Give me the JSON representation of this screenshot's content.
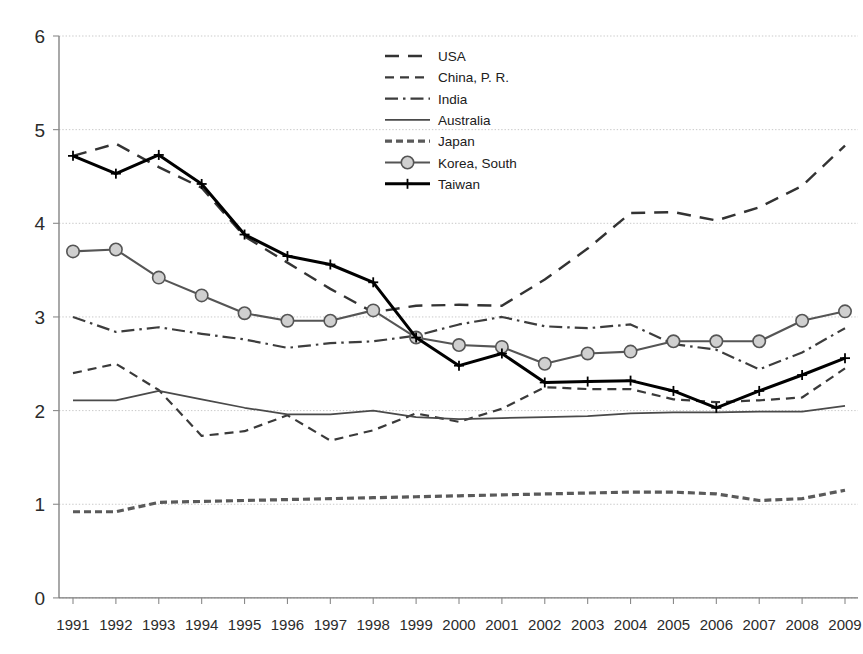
{
  "chart_data": {
    "type": "line",
    "title": "",
    "subtitle": "",
    "xlabel": "",
    "ylabel": "",
    "grid": true,
    "legend_position": "inside-top-center",
    "x": [
      1991,
      1992,
      1993,
      1994,
      1995,
      1996,
      1997,
      1998,
      1999,
      2000,
      2001,
      2002,
      2003,
      2004,
      2005,
      2006,
      2007,
      2008,
      2009
    ],
    "categories": [
      "1991",
      "1992",
      "1993",
      "1994",
      "1995",
      "1996",
      "1997",
      "1998",
      "1999",
      "2000",
      "2001",
      "2002",
      "2003",
      "2004",
      "2005",
      "2006",
      "2007",
      "2008",
      "2009"
    ],
    "xlim": [
      1991,
      2009
    ],
    "ylim": [
      0,
      6
    ],
    "yticks": [
      0,
      1,
      2,
      3,
      4,
      5,
      6
    ],
    "ytick_labels": [
      "0",
      "1",
      "2",
      "3",
      "4",
      "5",
      "6"
    ],
    "series": [
      {
        "name": "USA",
        "style": "long-dash",
        "color": "#333333",
        "width": 2.4,
        "marker": "none",
        "values": [
          4.72,
          4.85,
          4.6,
          4.38,
          3.86,
          3.58,
          3.3,
          3.05,
          3.12,
          3.13,
          3.12,
          3.4,
          3.73,
          4.11,
          4.12,
          4.03,
          4.17,
          4.4,
          4.83
        ]
      },
      {
        "name": "China, P. R.",
        "style": "short-dash",
        "color": "#3a3a3a",
        "width": 2.2,
        "marker": "none",
        "values": [
          2.4,
          2.5,
          2.22,
          1.73,
          1.78,
          1.95,
          1.68,
          1.79,
          1.97,
          1.88,
          2.02,
          2.25,
          2.23,
          2.23,
          2.12,
          2.09,
          2.11,
          2.14,
          2.45
        ]
      },
      {
        "name": "India",
        "style": "dash-dot",
        "color": "#3d3d3d",
        "width": 2.2,
        "marker": "none",
        "values": [
          3.0,
          2.84,
          2.89,
          2.82,
          2.76,
          2.67,
          2.72,
          2.74,
          2.8,
          2.92,
          3.0,
          2.9,
          2.88,
          2.92,
          2.71,
          2.65,
          2.44,
          2.62,
          2.88
        ]
      },
      {
        "name": "Australia",
        "style": "solid-thin",
        "color": "#4a4a4a",
        "width": 1.7,
        "marker": "none",
        "values": [
          2.11,
          2.11,
          2.21,
          2.12,
          2.03,
          1.96,
          1.96,
          2.0,
          1.93,
          1.91,
          1.92,
          1.93,
          1.94,
          1.97,
          1.98,
          1.98,
          1.99,
          1.99,
          2.05
        ]
      },
      {
        "name": "Japan",
        "style": "dotted",
        "color": "#5a5a5a",
        "width": 3.2,
        "marker": "none",
        "values": [
          0.92,
          0.92,
          1.02,
          1.03,
          1.04,
          1.05,
          1.06,
          1.07,
          1.08,
          1.09,
          1.1,
          1.11,
          1.12,
          1.13,
          1.13,
          1.11,
          1.04,
          1.06,
          1.15
        ]
      },
      {
        "name": "Korea, South",
        "style": "solid-marker",
        "color": "#555555",
        "width": 2.1,
        "marker": "circle",
        "values": [
          3.7,
          3.72,
          3.42,
          3.23,
          3.04,
          2.96,
          2.96,
          3.07,
          2.78,
          2.7,
          2.68,
          2.5,
          2.61,
          2.63,
          2.74,
          2.74,
          2.74,
          2.96,
          3.06
        ]
      },
      {
        "name": "Taiwan",
        "style": "solid-thick",
        "color": "#000000",
        "width": 3.0,
        "marker": "plus",
        "values": [
          4.72,
          4.53,
          4.73,
          4.42,
          3.88,
          3.65,
          3.56,
          3.37,
          2.78,
          2.48,
          2.61,
          2.3,
          2.31,
          2.32,
          2.21,
          2.03,
          2.21,
          2.38,
          2.56
        ]
      }
    ]
  },
  "legend": {
    "entries": [
      {
        "label": "USA"
      },
      {
        "label": "China, P. R."
      },
      {
        "label": "India"
      },
      {
        "label": "Australia"
      },
      {
        "label": "Japan"
      },
      {
        "label": "Korea, South"
      },
      {
        "label": "Taiwan"
      }
    ]
  }
}
